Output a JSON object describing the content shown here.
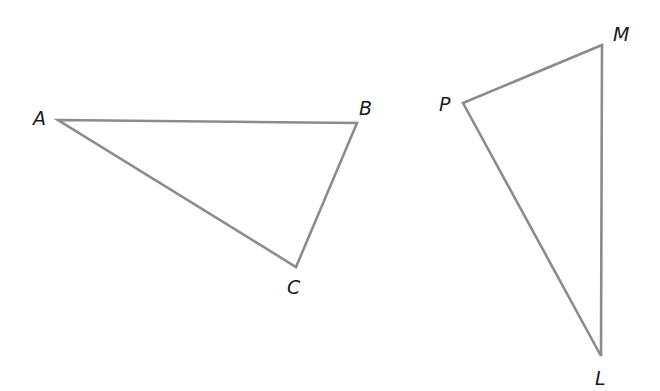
{
  "diagram": {
    "stroke_color": "#8c8c8c",
    "label_color": "#1a1a1a",
    "triangles": [
      {
        "name": "ABC",
        "vertices": [
          {
            "label": "A",
            "x": 58,
            "y": 120,
            "lx": 33,
            "ly": 125
          },
          {
            "label": "B",
            "x": 357,
            "y": 123,
            "lx": 359,
            "ly": 115
          },
          {
            "label": "C",
            "x": 296,
            "y": 267,
            "lx": 287,
            "ly": 294
          }
        ]
      },
      {
        "name": "PML",
        "vertices": [
          {
            "label": "P",
            "x": 463,
            "y": 103,
            "lx": 439,
            "ly": 111
          },
          {
            "label": "M",
            "x": 602,
            "y": 45,
            "lx": 613,
            "ly": 41
          },
          {
            "label": "L",
            "x": 601,
            "y": 356,
            "lx": 595,
            "ly": 385
          }
        ]
      }
    ]
  }
}
